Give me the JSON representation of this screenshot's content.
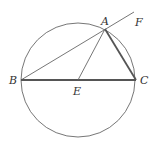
{
  "figure": {
    "circle": {
      "cx": 78,
      "cy": 80,
      "r": 57
    },
    "points": {
      "A": {
        "x": 105,
        "y": 29,
        "label": "A"
      },
      "B": {
        "x": 21,
        "y": 80,
        "label": "B"
      },
      "C": {
        "x": 136,
        "y": 80,
        "label": "C"
      },
      "E": {
        "x": 78,
        "y": 80,
        "label": "E"
      },
      "F": {
        "x": 132,
        "y": 13,
        "label": "F"
      }
    },
    "segments": [
      {
        "from": "B",
        "to": "F",
        "weight": "thin"
      },
      {
        "from": "B",
        "to": "C",
        "weight": "thick"
      },
      {
        "from": "A",
        "to": "C",
        "weight": "thick"
      },
      {
        "from": "A",
        "to": "E",
        "weight": "thin"
      }
    ],
    "colors": {
      "stroke": "#555555",
      "label": "#333333"
    }
  }
}
